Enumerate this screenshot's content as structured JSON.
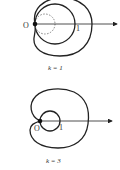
{
  "figures": [
    {
      "k_label": "k = 1",
      "origin_label": "O",
      "unit_label": "1",
      "has_dashed_circle": true
    },
    {
      "k_label": "k = 3",
      "origin_label": "O",
      "unit_label": "1",
      "has_dashed_circle": false
    }
  ],
  "colors": {
    "stroke": "#222222",
    "text": "#333333",
    "dashed": "#666666"
  }
}
